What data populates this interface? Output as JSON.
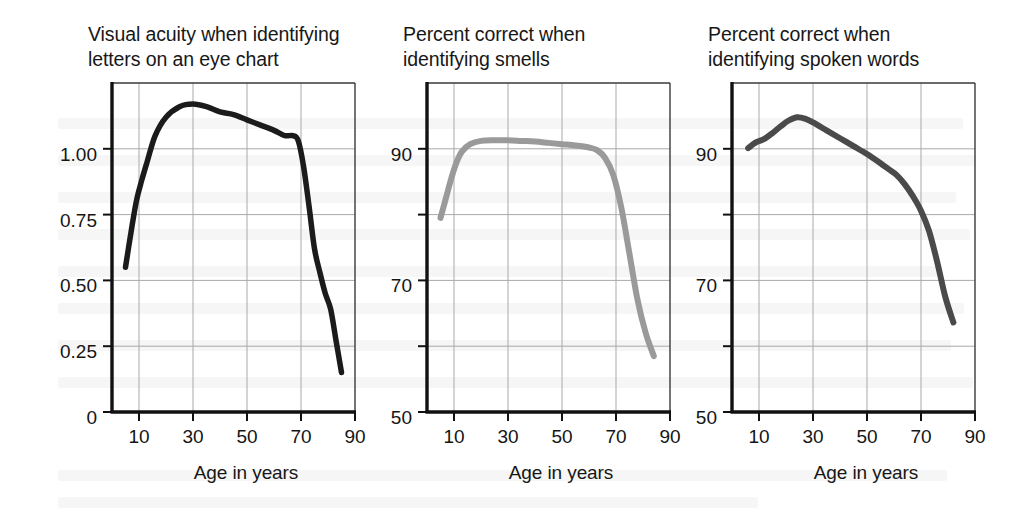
{
  "figure": {
    "background_color": "#ffffff",
    "panel_count": 3
  },
  "chart_data": [
    {
      "type": "line",
      "title": "Visual acuity when identifying\nletters on an eye chart",
      "xlabel": "Age in years",
      "ylabel": "",
      "xlim": [
        0,
        90
      ],
      "ylim": [
        0,
        1.25
      ],
      "xticks": [
        10,
        30,
        50,
        70,
        90
      ],
      "xticklabels": [
        "10",
        "30",
        "50",
        "70",
        "90"
      ],
      "yticks": [
        0,
        0.25,
        0.5,
        0.75,
        1.0
      ],
      "yticklabels": [
        "0",
        "0.25",
        "0.50",
        "0.75",
        "1.00"
      ],
      "grid": true,
      "grid_color": "#a9a9a9",
      "line_color": "#1b1b1b",
      "line_width": 5.5,
      "series": [
        {
          "name": "Visual acuity",
          "x": [
            5,
            7,
            9,
            11,
            13,
            16,
            20,
            25,
            30,
            35,
            40,
            45,
            50,
            55,
            60,
            64,
            67,
            69,
            71,
            73,
            75,
            77,
            79,
            81,
            83,
            85
          ],
          "y": [
            0.55,
            0.68,
            0.8,
            0.88,
            0.95,
            1.05,
            1.12,
            1.16,
            1.17,
            1.16,
            1.14,
            1.13,
            1.11,
            1.09,
            1.07,
            1.05,
            1.05,
            1.03,
            0.93,
            0.78,
            0.62,
            0.53,
            0.45,
            0.39,
            0.27,
            0.15
          ]
        }
      ]
    },
    {
      "type": "line",
      "title": "Percent correct when\nidentifying smells",
      "xlabel": "Age in years",
      "ylabel": "",
      "xlim": [
        0,
        90
      ],
      "ylim": [
        50,
        100
      ],
      "xticks": [
        10,
        30,
        50,
        70,
        90
      ],
      "xticklabels": [
        "10",
        "30",
        "50",
        "70",
        "90"
      ],
      "yticks": [
        50,
        60,
        70,
        80,
        90
      ],
      "yticklabels": [
        "50",
        "",
        "70",
        "",
        "90"
      ],
      "grid": true,
      "grid_color": "#a9a9a9",
      "line_color": "#9a9a9a",
      "line_width": 6,
      "series": [
        {
          "name": "Percent correct identifying smells",
          "x": [
            5,
            7,
            9,
            11,
            13,
            16,
            20,
            25,
            30,
            35,
            40,
            45,
            50,
            55,
            60,
            63,
            66,
            69,
            72,
            75,
            78,
            81,
            84
          ],
          "y": [
            79.5,
            82.5,
            85.5,
            88.0,
            89.6,
            90.7,
            91.2,
            91.3,
            91.3,
            91.2,
            91.1,
            90.9,
            90.7,
            90.5,
            90.2,
            89.8,
            88.6,
            86.0,
            81.0,
            74.0,
            67.0,
            62.0,
            58.5
          ]
        }
      ]
    },
    {
      "type": "line",
      "title": "Percent correct when\nidentifying spoken words",
      "xlabel": "Age in years",
      "ylabel": "",
      "xlim": [
        0,
        90
      ],
      "ylim": [
        50,
        100
      ],
      "xticks": [
        10,
        30,
        50,
        70,
        90
      ],
      "xticklabels": [
        "10",
        "30",
        "50",
        "70",
        "90"
      ],
      "yticks": [
        50,
        60,
        70,
        80,
        90
      ],
      "yticklabels": [
        "50",
        "",
        "70",
        "",
        "90"
      ],
      "grid": true,
      "grid_color": "#a9a9a9",
      "line_color": "#4a4a4a",
      "line_width": 6,
      "series": [
        {
          "name": "Percent correct identifying spoken words",
          "x": [
            6,
            9,
            12,
            15,
            18,
            21,
            24,
            27,
            30,
            35,
            40,
            45,
            50,
            55,
            58,
            61,
            64,
            67,
            70,
            73,
            76,
            79,
            82
          ],
          "y": [
            90.1,
            91.0,
            91.5,
            92.4,
            93.4,
            94.3,
            94.8,
            94.6,
            94.0,
            92.8,
            91.6,
            90.4,
            89.2,
            87.8,
            86.9,
            86.0,
            84.6,
            82.8,
            80.6,
            77.5,
            72.8,
            67.5,
            63.6
          ]
        }
      ]
    }
  ]
}
